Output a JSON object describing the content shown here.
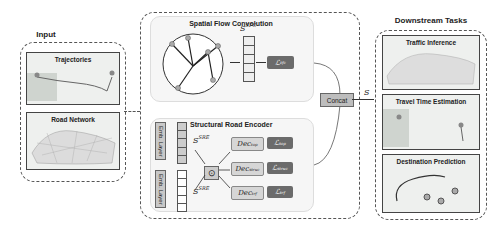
{
  "input": {
    "title": "Input",
    "cards": [
      {
        "label": "Trajectories"
      },
      {
        "label": "Road Network"
      }
    ]
  },
  "spatial_flow": {
    "title": "Spatial Flow Convolution",
    "embedding_label": "S",
    "embedding_sup": "SFC",
    "loss": "ℒ",
    "loss_sub": "tfc"
  },
  "structural": {
    "title": "Structural Road Encoder",
    "emb_layer_1": "Emb. Layer",
    "emb_layer_2": "Emb. Layer",
    "s1": "S",
    "s1_sup": "SRE",
    "s2": "S",
    "s2_sup": "SRE",
    "op": "⊙",
    "decoders": [
      {
        "dec": "Dec",
        "dec_sub": "top",
        "loss": "ℒ",
        "loss_sub": "top"
      },
      {
        "dec": "Dec",
        "dec_sub": "struc",
        "loss": "ℒ",
        "loss_sub": "struc"
      },
      {
        "dec": "Dec",
        "dec_sub": "trf",
        "loss": "ℒ",
        "loss_sub": "trf"
      }
    ]
  },
  "concat": {
    "label": "Concat"
  },
  "output_symbol": "S",
  "downstream": {
    "title": "Downstream Tasks",
    "cards": [
      {
        "label": "Traffic Inference"
      },
      {
        "label": "Travel Time Estimation"
      },
      {
        "label": "Destination Prediction"
      }
    ]
  },
  "colors": {
    "loss_box": "#6b6b6b",
    "decoder_box": "#d6d6d6",
    "panel_bg": "#f6f6f6"
  }
}
